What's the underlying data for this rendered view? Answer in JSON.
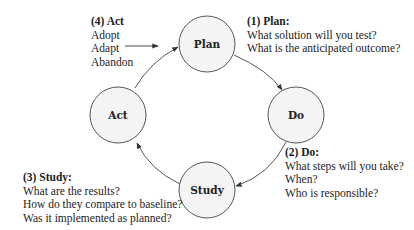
{
  "diagram": {
    "colors": {
      "node_fill": "#f4f4f4",
      "stroke": "#444444",
      "text": "#222222"
    },
    "nodes": [
      {
        "id": "plan",
        "label": "Plan",
        "cx": 207,
        "cy": 44
      },
      {
        "id": "do",
        "label": "Do",
        "cx": 296,
        "cy": 115
      },
      {
        "id": "study",
        "label": "Study",
        "cx": 207,
        "cy": 190
      },
      {
        "id": "act",
        "label": "Act",
        "cx": 118,
        "cy": 115
      }
    ],
    "edges": [
      {
        "from": "plan",
        "to": "do"
      },
      {
        "from": "do",
        "to": "study"
      },
      {
        "from": "study",
        "to": "act"
      },
      {
        "from": "act",
        "to": "plan"
      }
    ],
    "annotations": {
      "plan": {
        "heading": "(1) Plan:",
        "lines": [
          "What solution will you test?",
          "What is the anticipated outcome?"
        ]
      },
      "do": {
        "heading": "(2) Do:",
        "lines": [
          "What steps will you take?",
          "When?",
          "Who is responsible?"
        ]
      },
      "study": {
        "heading": "(3) Study:",
        "lines": [
          "What are the results?",
          "How do they compare to baseline?",
          "Was it implemented as planned?"
        ]
      },
      "act": {
        "heading": "(4) Act",
        "lines": [
          "Adopt",
          "Adapt",
          "Abandon"
        ]
      }
    }
  }
}
